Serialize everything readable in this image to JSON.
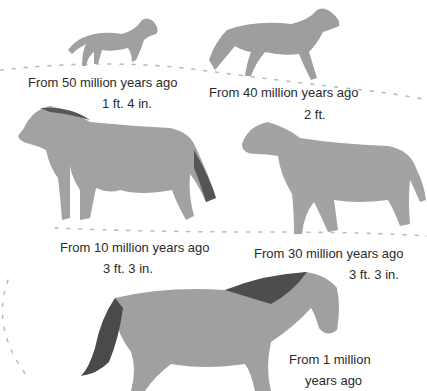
{
  "diagram": {
    "stages": [
      {
        "id": "eohippus",
        "label": "From 50 million years ago",
        "height": "1 ft. 4 in."
      },
      {
        "id": "mesohippus",
        "label": "From 40 million years ago",
        "height": "2 ft."
      },
      {
        "id": "merychippus",
        "label": "From 30 million years ago",
        "height": "3 ft. 3 in."
      },
      {
        "id": "pliohippus",
        "label": "From 10 million years ago",
        "height": "3 ft. 3 in."
      },
      {
        "id": "equus",
        "label_line1": "From 1 million",
        "label_line2": "years ago"
      }
    ],
    "colors": {
      "horse_body": "#9a9a9a",
      "horse_mane": "#4a4a4a",
      "trail": "#b8b8b8",
      "text": "#2b2b2b"
    }
  }
}
